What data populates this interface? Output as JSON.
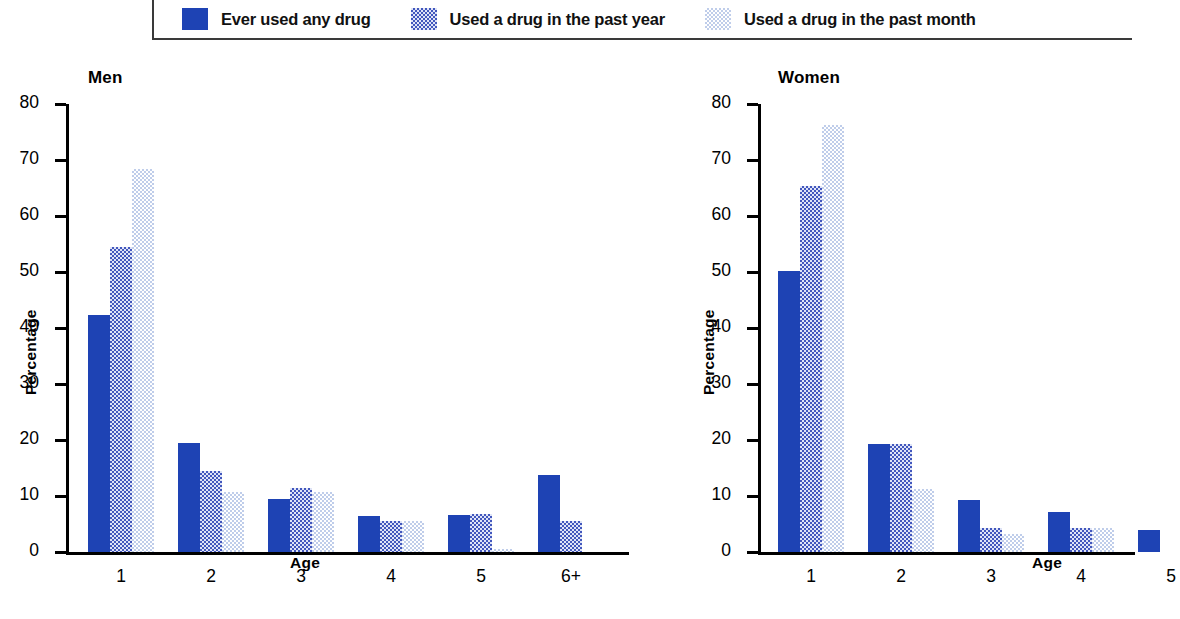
{
  "legend": {
    "items": [
      {
        "label": "Ever used any drug",
        "swatch": "solid-dark-blue",
        "color": "#1e43b4"
      },
      {
        "label": "Used a drug in the past year",
        "swatch": "dither-medium-blue",
        "color": "#4257bd"
      },
      {
        "label": "Used a drug in the past month",
        "swatch": "dither-light-blue",
        "color": "#bfcdea"
      }
    ]
  },
  "chart_data": [
    {
      "type": "bar",
      "title": "Men",
      "xlabel": "Age",
      "ylabel": "Percentage",
      "categories": [
        "1",
        "2",
        "3",
        "4",
        "5",
        "6+"
      ],
      "ylim": [
        0,
        80
      ],
      "yticks": [
        0,
        10,
        20,
        30,
        40,
        50,
        60,
        70,
        80
      ],
      "grid": false,
      "legend_position": "top",
      "series": [
        {
          "name": "Ever used any drug",
          "color": "#1e43b4",
          "values": [
            42.3,
            19.5,
            9.5,
            6.5,
            6.6,
            13.7
          ]
        },
        {
          "name": "Used a drug in the past year",
          "color": "#4257bd",
          "values": [
            54.4,
            14.5,
            11.5,
            5.5,
            6.7,
            5.5
          ]
        },
        {
          "name": "Used a drug in the past month",
          "color": "#bfcdea",
          "values": [
            68.4,
            10.7,
            10.7,
            5.5,
            0.5,
            0.0
          ]
        }
      ]
    },
    {
      "type": "bar",
      "title": "Women",
      "xlabel": "Age",
      "ylabel": "Percentage",
      "categories": [
        "1",
        "2",
        "3",
        "4",
        "5"
      ],
      "ylim": [
        0,
        80
      ],
      "yticks": [
        0,
        10,
        20,
        30,
        40,
        50,
        60,
        70,
        80
      ],
      "grid": false,
      "legend_position": "top",
      "note": "fifth age group is cropped at the right edge of the image",
      "series": [
        {
          "name": "Ever used any drug",
          "color": "#1e43b4",
          "values": [
            50.2,
            19.2,
            9.2,
            7.2,
            4.0
          ]
        },
        {
          "name": "Used a drug in the past year",
          "color": "#4257bd",
          "values": [
            65.3,
            19.2,
            4.2,
            4.2,
            0.0
          ]
        },
        {
          "name": "Used a drug in the past month",
          "color": "#bfcdea",
          "values": [
            76.3,
            11.2,
            3.3,
            4.2,
            0.0
          ]
        }
      ]
    }
  ],
  "men": {
    "title": "Men",
    "ylabel": "Percentage",
    "xlabel": "Age",
    "yticks": [
      "80",
      "70",
      "60",
      "50",
      "40",
      "30",
      "20",
      "10",
      "0"
    ],
    "categories": [
      "1",
      "2",
      "3",
      "4",
      "5",
      "6+"
    ]
  },
  "women": {
    "title": "Women",
    "ylabel": "Percentage",
    "xlabel": "Age",
    "yticks": [
      "80",
      "70",
      "60",
      "50",
      "40",
      "30",
      "20",
      "10",
      "0"
    ],
    "categories": [
      "1",
      "2",
      "3",
      "4",
      "5"
    ]
  }
}
